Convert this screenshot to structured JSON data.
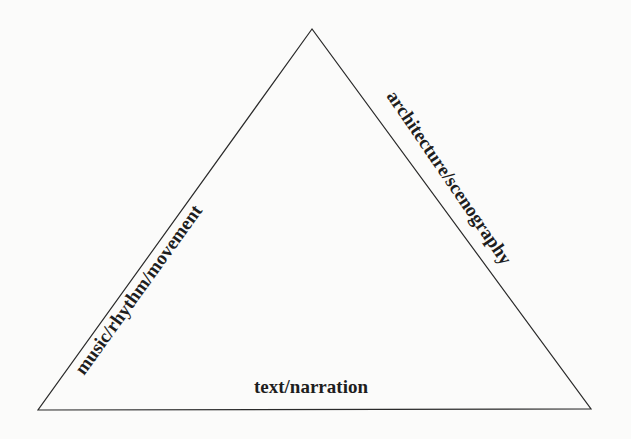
{
  "diagram": {
    "type": "triangle",
    "vertices": {
      "apex": [
        312,
        29
      ],
      "bottom_left": [
        38,
        410
      ],
      "bottom_right": [
        591,
        409
      ]
    },
    "stroke_color": "#2a2a2a",
    "background_color": "#fbfbfa",
    "labels": {
      "left_side": "music/rhythm/movement",
      "right_side": "architecture/scenography",
      "base": "text/narration"
    }
  }
}
